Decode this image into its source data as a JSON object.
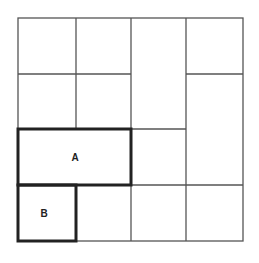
{
  "diagram": {
    "type": "grid-tiling",
    "grid": {
      "rows": 4,
      "cols": 4
    },
    "regions": [
      {
        "id": "A",
        "label": "A",
        "cells": "row 3, cols 1-2",
        "highlighted": true
      },
      {
        "id": "B",
        "label": "B",
        "cells": "row 4, col 1",
        "highlighted": true
      }
    ],
    "colors": {
      "line": "#444444",
      "bold_line": "#222222",
      "background": "#ffffff"
    }
  },
  "labels": {
    "a": "A",
    "b": "B"
  }
}
